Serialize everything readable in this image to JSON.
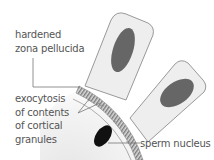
{
  "diagram": {
    "labels": {
      "zona_pellucida": [
        "hardened",
        "zona pellucida"
      ],
      "exocytosis": [
        "exocytosis",
        "of contents",
        "of cortical",
        "granules"
      ],
      "sperm_nucleus": "sperm nucleus"
    },
    "elements": {
      "cells": 2,
      "cell_fill": "#eeeeee",
      "cell_stroke": "#999999",
      "nucleus_fill": "#666666",
      "sperm_nucleus_fill": "#111111",
      "zona_band_fill": "#bdbdbd",
      "leader_line_color": "#777777"
    }
  }
}
